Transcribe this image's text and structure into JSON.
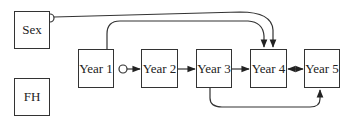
{
  "diagram": {
    "colors": {
      "stroke": "#333333",
      "text": "#222222",
      "background": "#ffffff"
    },
    "nodes": [
      {
        "id": "sex",
        "label": "Sex",
        "x": 14,
        "y": 11,
        "w": 36,
        "h": 38
      },
      {
        "id": "fh",
        "label": "FH",
        "x": 14,
        "y": 78,
        "w": 36,
        "h": 38
      },
      {
        "id": "year1",
        "label": "Year 1",
        "x": 78,
        "y": 49,
        "w": 36,
        "h": 39
      },
      {
        "id": "year2",
        "label": "Year 2",
        "x": 141,
        "y": 49,
        "w": 37,
        "h": 39
      },
      {
        "id": "year3",
        "label": "Year 3",
        "x": 196,
        "y": 49,
        "w": 36,
        "h": 39
      },
      {
        "id": "year4",
        "label": "Year 4",
        "x": 250,
        "y": 49,
        "w": 37,
        "h": 39
      },
      {
        "id": "year5",
        "label": "Year 5",
        "x": 304,
        "y": 49,
        "w": 36,
        "h": 39
      }
    ],
    "edges": [
      {
        "from": "Sex",
        "to": "Year 4",
        "tail": "circle",
        "head": "arrow",
        "shape": "curve-over-top"
      },
      {
        "from": "Year 1",
        "to": "Year 4",
        "tail": "none",
        "head": "arrow",
        "shape": "curve-over-top"
      },
      {
        "from": "Year 1",
        "to": "Year 2",
        "tail": "circle",
        "head": "arrow",
        "shape": "straight"
      },
      {
        "from": "Year 2",
        "to": "Year 3",
        "tail": "none",
        "head": "arrow",
        "shape": "straight"
      },
      {
        "from": "Year 3",
        "to": "Year 4",
        "tail": "none",
        "head": "arrow",
        "shape": "straight"
      },
      {
        "from": "Year 4",
        "to": "Year 5",
        "tail": "arrow",
        "head": "arrow",
        "shape": "straight-bidirected"
      },
      {
        "from": "Year 3",
        "to": "Year 5",
        "tail": "none",
        "head": "arrow",
        "shape": "curve-under-bottom"
      }
    ]
  }
}
